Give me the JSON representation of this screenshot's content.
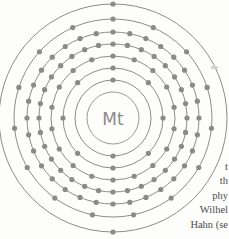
{
  "page": {
    "background_color": "#fdfdfc",
    "width": 229,
    "height": 239
  },
  "diagram": {
    "kind": "bohr-atomic-model",
    "element_symbol": "Mt",
    "element_name": "Meitnerium",
    "atomic_number": 109,
    "shell_count": 7,
    "shell_electrons": [
      2,
      8,
      18,
      32,
      32,
      15,
      2
    ],
    "colors": {
      "shell_stroke": "#8c8c8c",
      "electron_fill": "#8a8a8a",
      "nucleus_stroke": "#9a9a9a",
      "nucleus_text": "#8a8a8a"
    },
    "center": {
      "x": 113,
      "y": 118
    },
    "nucleus_radius": 26,
    "shell_radii": [
      38,
      50,
      62,
      74,
      86,
      99,
      114
    ]
  },
  "chart_data": {
    "type": "scatter",
    "title": "Mt",
    "xlabel": "",
    "ylabel": "",
    "categories": [
      "Shell 1",
      "Shell 2",
      "Shell 3",
      "Shell 4",
      "Shell 5",
      "Shell 6",
      "Shell 7"
    ],
    "values": [
      2,
      8,
      18,
      32,
      32,
      15,
      2
    ],
    "series": [
      {
        "name": "electrons per shell",
        "values": [
          2,
          8,
          18,
          32,
          32,
          15,
          2
        ]
      }
    ],
    "radii": [
      38,
      50,
      62,
      74,
      86,
      99,
      114
    ],
    "grid": false,
    "legend": "none",
    "annotations": [
      "Mt"
    ]
  },
  "side_text": {
    "lines": [
      "t",
      "th",
      "phy",
      "Wilhel",
      "Hahn  (se"
    ]
  }
}
